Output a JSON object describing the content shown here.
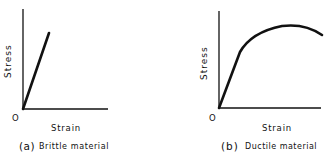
{
  "panels": [
    {
      "id": "a",
      "y_label": "Stress",
      "x_label": "Strain",
      "origin_label": "O",
      "caption_prefix": "(a)",
      "caption_text": "Brittle material"
    },
    {
      "id": "b",
      "y_label": "Stress",
      "x_label": "Strain",
      "origin_label": "O",
      "caption_prefix": "(b)",
      "caption_text": "Ductile material"
    }
  ],
  "colors": {
    "ink": "#111111",
    "background": "#ffffff"
  }
}
